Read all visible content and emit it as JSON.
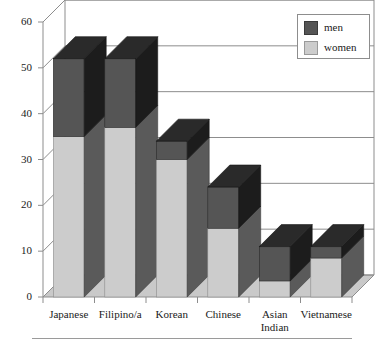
{
  "chart_data": {
    "type": "bar",
    "subtype": "stacked-3d-column",
    "title": "",
    "subtitle": "",
    "xlabel": "",
    "ylabel": "",
    "ylim": [
      0,
      60
    ],
    "yticks": [
      0,
      10,
      20,
      30,
      40,
      50,
      60
    ],
    "ytick_labels": [
      "0",
      "10",
      "20",
      "30",
      "40",
      "50",
      "60"
    ],
    "grid": true,
    "grid_axis": "y",
    "legend_position": "top-right",
    "categories": [
      "Japanese",
      "Filipino/a",
      "Korean",
      "Chinese",
      "Asian Indian",
      "Vietnamese"
    ],
    "category_label_lines": [
      [
        "Japanese"
      ],
      [
        "Filipino/a"
      ],
      [
        "Korean"
      ],
      [
        "Chinese"
      ],
      [
        "Asian",
        "Indian"
      ],
      [
        "Vietnamese"
      ]
    ],
    "series": [
      {
        "name": "women",
        "color": "#cccccc",
        "values": [
          35,
          37,
          30,
          15,
          3.5,
          8.5
        ]
      },
      {
        "name": "men",
        "color": "#555555",
        "values": [
          17,
          15,
          4,
          9,
          7.5,
          2.5
        ]
      }
    ],
    "totals": [
      52,
      52,
      34,
      24,
      11,
      11
    ],
    "annotations": []
  },
  "legend": {
    "items": [
      {
        "label": "men",
        "swatch_color": "#555555"
      },
      {
        "label": "women",
        "swatch_color": "#cccccc"
      }
    ]
  },
  "colors": {
    "men_front": "#555555",
    "men_side": "#1c1c1c",
    "men_top": "#2a2a2a",
    "women_front": "#cccccc",
    "women_side": "#5a5a5a",
    "floor": "#c9c9c9",
    "frame": "#8d8d8d",
    "grid": "#8d8d8d",
    "text": "#1a1a1a"
  }
}
